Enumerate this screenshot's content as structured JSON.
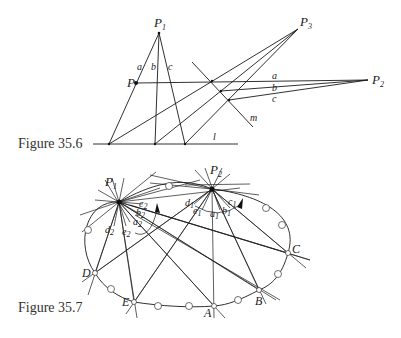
{
  "figures": [
    {
      "caption": "Figure 35.6",
      "points": {
        "P1": {
          "label": "P",
          "sub": "1"
        },
        "P2": {
          "label": "P",
          "sub": "2"
        },
        "P3": {
          "label": "P",
          "sub": "3"
        },
        "P": {
          "label": "P"
        }
      },
      "line_labels": {
        "a_left": "a",
        "b_left": "b",
        "c_left": "c",
        "a_right": "a",
        "b_right": "b",
        "c_right": "c",
        "l": "l",
        "m": "m"
      }
    },
    {
      "caption": "Figure 35.7",
      "points": {
        "P1": {
          "label": "P",
          "sub": "1"
        },
        "P2": {
          "label": "P",
          "sub": "2"
        },
        "A": "A",
        "B": "B",
        "C": "C",
        "D": "D",
        "E": "E"
      },
      "ray_labels_P1": {
        "d2": {
          "label": "d",
          "sub": "2"
        },
        "e2": {
          "label": "e",
          "sub": "2"
        },
        "a2": {
          "label": "a",
          "sub": "2"
        },
        "b2": {
          "label": "b",
          "sub": "2"
        },
        "c2": {
          "label": "c",
          "sub": "2"
        }
      },
      "ray_labels_P2": {
        "d1": {
          "label": "d",
          "sub": "1"
        },
        "e1": {
          "label": "e",
          "sub": "1"
        },
        "a1": {
          "label": "a",
          "sub": "1"
        },
        "b1": {
          "label": "b",
          "sub": "1"
        },
        "c1": {
          "label": "c",
          "sub": "1"
        }
      }
    }
  ]
}
